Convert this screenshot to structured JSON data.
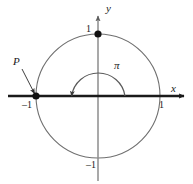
{
  "figure": {
    "kind": "unit-circle-diagram",
    "background_color": "#ffffff",
    "labels": {
      "y_axis": "y",
      "x_axis": "x",
      "point_p": "P",
      "angle": "π",
      "y_one": "1",
      "x_one": "1",
      "x_neg_one": "–1",
      "y_neg_one": "–1"
    },
    "colors": {
      "circle": "#6f6f6f",
      "x_axis": "#1a1a1a",
      "y_axis": "#8a8a8a",
      "arc": "#5a5a5a",
      "point": "#111111",
      "leader": "#2a2a2a",
      "text": "#1a1a1a"
    },
    "geometry": {
      "center_x": 98,
      "center_y": 96,
      "radius": 62,
      "arc_radius": 27,
      "x_axis_y": 96,
      "y_axis_x": 98
    },
    "points": [
      {
        "name": "top-point",
        "label": "1",
        "x": 98,
        "y": 34,
        "coords": "(0, 1)"
      },
      {
        "name": "point-p",
        "label": "P",
        "x": 36,
        "y": 96,
        "coords": "(–1, 0)"
      }
    ],
    "angle_arc": {
      "label": "π",
      "start_degrees": 0,
      "end_degrees": 180,
      "direction": "counterclockwise",
      "arrowhead_at": "end"
    }
  }
}
